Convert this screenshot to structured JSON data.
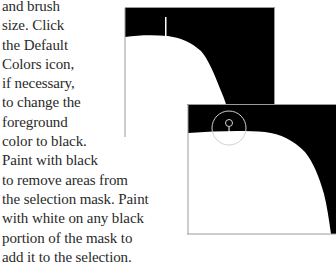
{
  "instruction_text": {
    "lines": [
      "and brush",
      "size. Click",
      "the Default",
      "Colors icon,",
      "if necessary,",
      "to change the",
      "foreground",
      "color to black.",
      "Paint with black",
      "to remove areas from",
      "the selection mask. Paint",
      "with white on any black",
      "portion of the mask to",
      "add it to the selection."
    ]
  },
  "figures": {
    "before": {
      "description": "selection mask with brush cursor line",
      "mask_color": "#000000",
      "selection_color": "#ffffff",
      "border_color": "#9a9a9a"
    },
    "after": {
      "description": "selection mask with circular brush cursor",
      "mask_color": "#000000",
      "selection_color": "#ffffff",
      "cursor_color": "#cfcfcf",
      "border_color": "#9a9a9a"
    }
  }
}
